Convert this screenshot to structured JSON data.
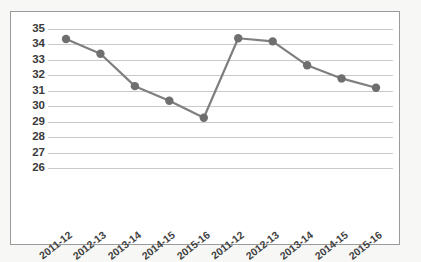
{
  "chart_data": {
    "type": "line",
    "title": "",
    "subtitle": "",
    "xlabel": "",
    "ylabel": "",
    "categories": [
      "2011-12",
      "2012-13",
      "2013-14",
      "2014-15",
      "2015-16",
      "2011-12",
      "2012-13",
      "2013-14",
      "2014-15",
      "2015-16"
    ],
    "values": [
      34.35,
      33.4,
      31.3,
      30.35,
      29.25,
      34.4,
      34.2,
      32.65,
      31.8,
      31.2
    ],
    "series": [
      {
        "name": "",
        "values": [
          34.35,
          33.4,
          31.3,
          30.35,
          29.25,
          34.4,
          34.2,
          32.65,
          31.8,
          31.2
        ]
      }
    ],
    "ylim": [
      26,
      35
    ],
    "ytick_labels": [
      "35",
      "34",
      "33",
      "32",
      "31",
      "30",
      "29",
      "28",
      "27",
      "26"
    ],
    "ytick_values": [
      35,
      34,
      33,
      32,
      31,
      30,
      29,
      28,
      27,
      26
    ],
    "xtick_labels": [
      "2011-12",
      "2012-13",
      "2013-14",
      "2014-15",
      "2015-16",
      "2011-12",
      "2012-13",
      "2013-14",
      "2014-15",
      "2015-16"
    ],
    "grid": true,
    "grid_axis": "y",
    "legend": false,
    "legend_position": "none",
    "annotations": [],
    "colors": {
      "line": "#7f7f7f",
      "marker": "#6f6f6f",
      "gridline": "#c9c9c9",
      "axis_text": "#3a3a3a",
      "plot_background": "#ffffff",
      "page_background": "#f7f7f5",
      "frame_border": "#9a9a9a"
    },
    "line_width": 2.2,
    "marker_shape": "circle",
    "marker_radius": 4.2
  }
}
